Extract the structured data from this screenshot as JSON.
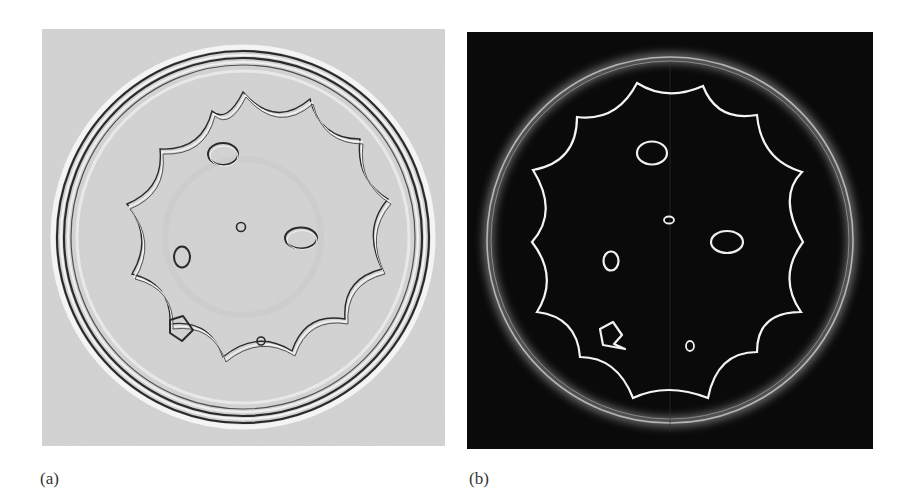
{
  "figure": {
    "panels": [
      {
        "id": "a",
        "label": "(a)",
        "style": "edge-filtered grayscale (dark edges on light gray background)",
        "background": "#d6d6d6",
        "edge_color": "#2a2a2a",
        "highlight_color": "#ffffff"
      },
      {
        "id": "b",
        "label": "(b)",
        "style": "edge-magnitude (bright edges on black background)",
        "background": "#0a0a0a",
        "edge_color": "#f2f2f2",
        "ring_color": "#9a9a9a"
      }
    ],
    "objects": [
      "outer-circular-ring",
      "12-point-scalloped-star-boundary",
      "ellipse-top",
      "small-circle-center",
      "ellipse-right",
      "ellipse-left-vertical",
      "pentagon-star-bottom-left",
      "small-circle-bottom"
    ]
  }
}
